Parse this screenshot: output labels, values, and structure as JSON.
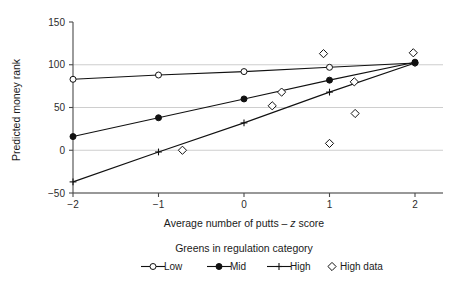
{
  "chart_data": {
    "type": "line",
    "title": "",
    "xlabel": "Average number of putts – z score",
    "ylabel": "Predicted money rank",
    "xlim": [
      -2.35,
      2.2
    ],
    "ylim": [
      -62,
      158
    ],
    "xticks": [
      -2,
      -1,
      0,
      1,
      2
    ],
    "xtick_labels": [
      "−2",
      "−1",
      "0",
      "1",
      "2"
    ],
    "yticks": [
      -50,
      0,
      50,
      100,
      150
    ],
    "ytick_labels": [
      "−50",
      "0",
      "50",
      "100",
      "150"
    ],
    "grid": "horizontal",
    "gridlines_y": [
      -50,
      0,
      50,
      100
    ],
    "legend_position": "below",
    "legend_title": "Greens in regulation category",
    "x": [
      -2,
      -1,
      0,
      1,
      2
    ],
    "series": [
      {
        "name": "Low",
        "marker": "open-circle",
        "values": [
          83,
          88,
          92,
          97,
          102
        ]
      },
      {
        "name": "Mid",
        "marker": "filled-circle",
        "values": [
          16,
          38,
          60,
          82,
          103
        ]
      },
      {
        "name": "High",
        "marker": "plus",
        "values": [
          -37,
          -2,
          32,
          68,
          102
        ]
      }
    ],
    "scatter": [
      {
        "name": "High data",
        "marker": "open-diamond",
        "points": [
          [
            -0.72,
            0
          ],
          [
            0.33,
            52
          ],
          [
            0.44,
            68
          ],
          [
            0.93,
            113
          ],
          [
            1.0,
            8
          ],
          [
            1.29,
            80
          ],
          [
            1.3,
            43
          ],
          [
            1.98,
            114
          ]
        ]
      }
    ]
  },
  "xaxis": {
    "label_prefix": "Average number of putts – ",
    "label_italic": "z",
    "label_suffix": " score"
  },
  "yaxis": {
    "label": "Predicted money rank"
  },
  "legend": {
    "title": "Greens in regulation category",
    "items": [
      {
        "label": "Low"
      },
      {
        "label": "Mid"
      },
      {
        "label": "High"
      },
      {
        "label": "High data"
      }
    ]
  },
  "colors": {
    "ink": "#111111",
    "grid": "#b9b9b9",
    "axis": "#4a4a4a",
    "background": "#ffffff"
  }
}
